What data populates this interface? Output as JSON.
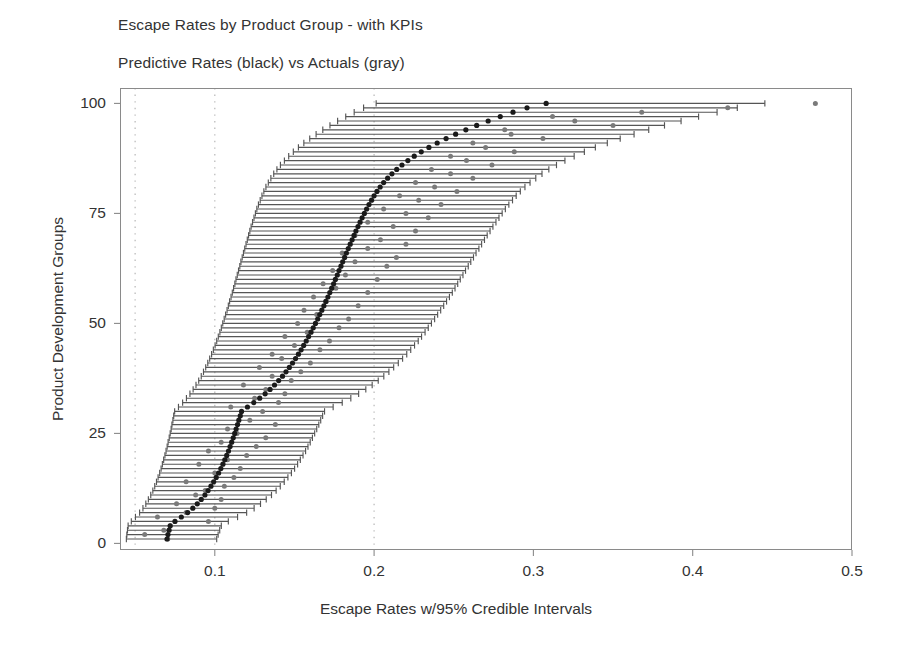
{
  "chart_data": {
    "type": "scatter",
    "title": "Escape Rates by Product Group - with KPIs",
    "subtitle": "Predictive Rates (black) vs Actuals (gray)",
    "xlabel": "Escape Rates w/95% Credible Intervals",
    "ylabel": "Product Development Groups",
    "xlim": [
      0.0405,
      0.5
    ],
    "ylim": [
      -1,
      103
    ],
    "xticks": [
      0.1,
      0.2,
      0.3,
      0.4,
      0.5
    ],
    "xtick_labels": [
      "0.1",
      "0.2",
      "0.3",
      "0.4",
      "0.5"
    ],
    "yticks": [
      0,
      25,
      50,
      75,
      100
    ],
    "ytick_labels": [
      "0",
      "25",
      "50",
      "75",
      "100"
    ],
    "gridlines_x": [
      0.05,
      0.1,
      0.2
    ],
    "grid": "dotted vertical only",
    "legend": "none (encoded in subtitle: black = predictive, gray = actuals)",
    "colors": {
      "predictive_point": "#1a1a1a",
      "credible_interval": "#555555",
      "actual_point": "#7a7a7a",
      "axis": "#8a8a8a",
      "gridline": "#bcbcbc",
      "text": "#333333"
    },
    "marker_sizes": {
      "predictive_point_px": 5.2,
      "actual_point_px": 5.0
    },
    "series": [
      {
        "name": "Predictive Rates (black)",
        "color": "#1a1a1a",
        "ylabel": "group rank",
        "y": [
          1,
          2,
          3,
          4,
          5,
          6,
          7,
          8,
          9,
          10,
          11,
          12,
          13,
          14,
          15,
          16,
          17,
          18,
          19,
          20,
          21,
          22,
          23,
          24,
          25,
          26,
          27,
          28,
          29,
          30,
          31,
          32,
          33,
          34,
          35,
          36,
          37,
          38,
          39,
          40,
          41,
          42,
          43,
          44,
          45,
          46,
          47,
          48,
          49,
          50,
          51,
          52,
          53,
          54,
          55,
          56,
          57,
          58,
          59,
          60,
          61,
          62,
          63,
          64,
          65,
          66,
          67,
          68,
          69,
          70,
          71,
          72,
          73,
          74,
          75,
          76,
          77,
          78,
          79,
          80,
          81,
          82,
          83,
          84,
          85,
          86,
          87,
          88,
          89,
          90,
          91,
          92,
          93,
          94,
          95,
          96,
          97,
          98,
          99,
          100
        ],
        "values": [
          0.07,
          0.0706,
          0.0713,
          0.072,
          0.075,
          0.079,
          0.083,
          0.0862,
          0.089,
          0.0915,
          0.0938,
          0.0958,
          0.0976,
          0.0993,
          0.1009,
          0.1024,
          0.1038,
          0.1051,
          0.1063,
          0.1075,
          0.1086,
          0.1096,
          0.1106,
          0.1116,
          0.1125,
          0.1134,
          0.1143,
          0.1151,
          0.116,
          0.1168,
          0.1205,
          0.1245,
          0.1282,
          0.1316,
          0.1347,
          0.1375,
          0.1401,
          0.1425,
          0.1447,
          0.1468,
          0.1488,
          0.1507,
          0.1525,
          0.1542,
          0.1558,
          0.1574,
          0.1589,
          0.1604,
          0.1618,
          0.1632,
          0.1646,
          0.1659,
          0.1672,
          0.1685,
          0.1697,
          0.171,
          0.1722,
          0.1734,
          0.1746,
          0.1757,
          0.1769,
          0.178,
          0.1792,
          0.1803,
          0.1815,
          0.1826,
          0.1838,
          0.185,
          0.1862,
          0.1874,
          0.1886,
          0.1899,
          0.1912,
          0.1925,
          0.1939,
          0.1953,
          0.1968,
          0.1984,
          0.2,
          0.2018,
          0.2038,
          0.206,
          0.2085,
          0.2112,
          0.2142,
          0.2175,
          0.2212,
          0.2252,
          0.2296,
          0.2344,
          0.2396,
          0.2452,
          0.2512,
          0.2576,
          0.2644,
          0.2716,
          0.2792,
          0.2872,
          0.296,
          0.308
        ]
      },
      {
        "name": "Actuals (gray)",
        "color": "#7a7a7a",
        "ylabel": "group rank",
        "y": [
          1,
          2,
          3,
          4,
          5,
          6,
          7,
          8,
          9,
          10,
          11,
          12,
          13,
          14,
          15,
          16,
          17,
          18,
          19,
          20,
          21,
          22,
          23,
          24,
          25,
          26,
          27,
          28,
          29,
          30,
          31,
          32,
          33,
          34,
          35,
          36,
          37,
          38,
          39,
          40,
          41,
          42,
          43,
          44,
          45,
          46,
          47,
          48,
          49,
          50,
          51,
          52,
          53,
          54,
          55,
          56,
          57,
          58,
          59,
          60,
          61,
          62,
          63,
          64,
          65,
          66,
          67,
          68,
          69,
          70,
          71,
          72,
          73,
          74,
          75,
          76,
          77,
          78,
          79,
          80,
          81,
          82,
          83,
          84,
          85,
          86,
          87,
          88,
          89,
          90,
          91,
          92,
          93,
          94,
          95,
          96,
          97,
          98,
          99,
          100
        ],
        "values": [
          0.0705,
          0.056,
          0.068,
          0.072,
          0.096,
          0.064,
          0.082,
          0.1,
          0.076,
          0.104,
          0.088,
          0.094,
          0.106,
          0.082,
          0.112,
          0.1,
          0.116,
          0.09,
          0.108,
          0.12,
          0.096,
          0.126,
          0.104,
          0.132,
          0.114,
          0.108,
          0.138,
          0.122,
          0.116,
          0.13,
          0.11,
          0.14,
          0.125,
          0.144,
          0.132,
          0.118,
          0.148,
          0.136,
          0.154,
          0.128,
          0.16,
          0.142,
          0.136,
          0.166,
          0.15,
          0.172,
          0.144,
          0.158,
          0.178,
          0.152,
          0.184,
          0.164,
          0.156,
          0.19,
          0.17,
          0.162,
          0.196,
          0.176,
          0.168,
          0.202,
          0.182,
          0.174,
          0.208,
          0.188,
          0.214,
          0.18,
          0.196,
          0.22,
          0.204,
          0.188,
          0.226,
          0.212,
          0.196,
          0.234,
          0.22,
          0.206,
          0.242,
          0.228,
          0.216,
          0.252,
          0.238,
          0.226,
          0.262,
          0.248,
          0.236,
          0.274,
          0.258,
          0.248,
          0.288,
          0.27,
          0.262,
          0.306,
          0.286,
          0.282,
          0.35,
          0.326,
          0.312,
          0.368,
          0.422,
          0.477
        ]
      }
    ],
    "credible_intervals": {
      "description": "95% credible interval per group (lower, upper)",
      "lower": [
        0.0445,
        0.0448,
        0.0452,
        0.0456,
        0.0476,
        0.0502,
        0.0528,
        0.0549,
        0.0567,
        0.0583,
        0.0598,
        0.0611,
        0.0623,
        0.0634,
        0.0644,
        0.0654,
        0.0663,
        0.0671,
        0.0679,
        0.0687,
        0.0694,
        0.0701,
        0.0707,
        0.0714,
        0.072,
        0.0726,
        0.0731,
        0.0737,
        0.0742,
        0.0748,
        0.0772,
        0.0798,
        0.0822,
        0.0844,
        0.0864,
        0.0882,
        0.0899,
        0.0915,
        0.0929,
        0.0943,
        0.0956,
        0.0968,
        0.098,
        0.0991,
        0.1002,
        0.1012,
        0.1022,
        0.1032,
        0.1041,
        0.105,
        0.1059,
        0.1068,
        0.1077,
        0.1085,
        0.1093,
        0.1102,
        0.111,
        0.1118,
        0.1126,
        0.1133,
        0.1141,
        0.1149,
        0.1157,
        0.1164,
        0.1172,
        0.118,
        0.1188,
        0.1196,
        0.1204,
        0.1212,
        0.122,
        0.1228,
        0.1237,
        0.1246,
        0.1255,
        0.1264,
        0.1274,
        0.1285,
        0.1296,
        0.1308,
        0.1321,
        0.1336,
        0.1352,
        0.137,
        0.139,
        0.1412,
        0.1437,
        0.1464,
        0.1493,
        0.1525,
        0.1559,
        0.1596,
        0.1636,
        0.1678,
        0.1723,
        0.1771,
        0.1822,
        0.1875,
        0.1934,
        0.2013
      ],
      "upper": [
        0.1012,
        0.1021,
        0.1031,
        0.1041,
        0.1085,
        0.1143,
        0.12,
        0.1247,
        0.1287,
        0.1323,
        0.1356,
        0.1385,
        0.1411,
        0.1436,
        0.1459,
        0.1481,
        0.1501,
        0.152,
        0.1537,
        0.1554,
        0.157,
        0.1585,
        0.1599,
        0.1613,
        0.1627,
        0.164,
        0.1653,
        0.1665,
        0.1677,
        0.1689,
        0.1743,
        0.18,
        0.1854,
        0.1903,
        0.1948,
        0.1988,
        0.2026,
        0.2061,
        0.2093,
        0.2123,
        0.2152,
        0.2179,
        0.2205,
        0.223,
        0.2254,
        0.2277,
        0.2298,
        0.232,
        0.234,
        0.236,
        0.238,
        0.2399,
        0.2418,
        0.2437,
        0.2455,
        0.2473,
        0.2491,
        0.2508,
        0.2525,
        0.2541,
        0.2558,
        0.2574,
        0.2591,
        0.2607,
        0.2624,
        0.264,
        0.2658,
        0.2675,
        0.2693,
        0.271,
        0.2728,
        0.2746,
        0.2765,
        0.2784,
        0.2804,
        0.2824,
        0.2846,
        0.2869,
        0.2892,
        0.2918,
        0.2947,
        0.2979,
        0.3015,
        0.3054,
        0.3097,
        0.3145,
        0.3198,
        0.3256,
        0.332,
        0.3389,
        0.3464,
        0.3545,
        0.3632,
        0.3724,
        0.3823,
        0.3927,
        0.4037,
        0.4153,
        0.428,
        0.4453
      ]
    }
  },
  "axis_geometry": {
    "plot_left_px": 120,
    "plot_right_px": 852,
    "plot_top_px": 88,
    "plot_bottom_px": 550,
    "x_min": 0.0405,
    "x_max": 0.5,
    "y_min": -1.5,
    "y_max": 103.5
  }
}
